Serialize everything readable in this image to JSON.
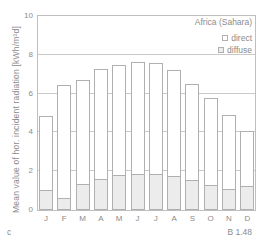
{
  "figure": {
    "panel_label": "c",
    "figure_ref": "B 1.48"
  },
  "chart_data": {
    "type": "bar",
    "stacked": true,
    "title": "Africa (Sahara)",
    "ylabel": "Mean value of hor. incident radiation [kWh/m²d]",
    "categories": [
      "J",
      "F",
      "M",
      "A",
      "M",
      "J",
      "J",
      "A",
      "S",
      "O",
      "N",
      "D"
    ],
    "ylim": [
      0,
      10
    ],
    "yticks": [
      0,
      2,
      4,
      6,
      8,
      10
    ],
    "grid": "horizontal",
    "legend_position": "top-right",
    "series": [
      {
        "name": "direct",
        "fill": "#ffffff",
        "values": [
          3.85,
          5.9,
          5.4,
          5.7,
          5.75,
          5.85,
          5.8,
          5.5,
          5.0,
          4.5,
          3.85,
          2.85
        ]
      },
      {
        "name": "diffuse",
        "fill": "#ececec",
        "values": [
          1.0,
          0.55,
          1.3,
          1.55,
          1.75,
          1.8,
          1.8,
          1.7,
          1.5,
          1.25,
          1.05,
          1.2
        ]
      }
    ],
    "totals": [
      4.85,
      6.45,
      6.7,
      7.25,
      7.5,
      7.65,
      7.6,
      7.2,
      6.5,
      5.75,
      4.9,
      4.05
    ],
    "colors": {
      "bar_border": "#b0b0b0",
      "diffuse_fill": "#ececec",
      "direct_fill": "#ffffff",
      "gridline": "#c9c9c9",
      "frame": "#bfbfbf",
      "text": "#8c8c8c"
    }
  }
}
